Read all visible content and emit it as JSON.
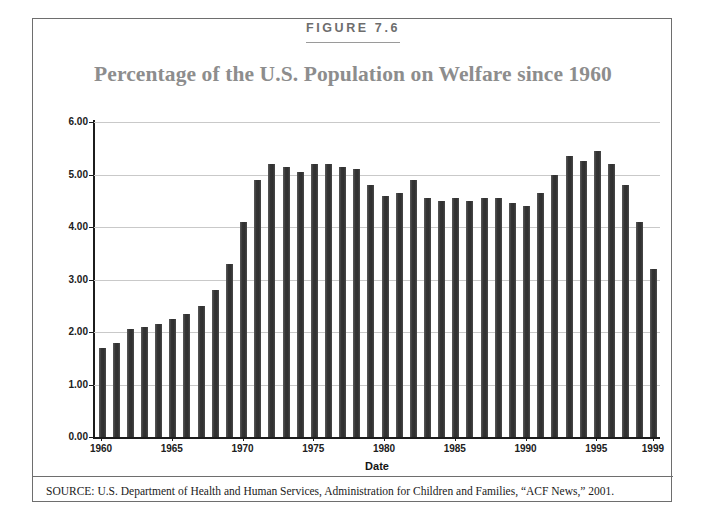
{
  "figure": {
    "label": "FIGURE 7.6",
    "title": "Percentage of the U.S. Population on Welfare since 1960",
    "source": "SOURCE:  U.S. Department of Health and Human Services, Administration for Children and Families, “ACF News,” 2001."
  },
  "colors": {
    "bar": "#3d3d3d",
    "title": "#8d8d8d",
    "label": "#6d6d6d",
    "grid": "#c9c9c9",
    "axis": "#1c1c1c",
    "frame": "#6e6e6e"
  },
  "chart_data": {
    "type": "bar",
    "title": "Percentage of the U.S. Population on Welfare since 1960",
    "xlabel": "Date",
    "ylabel": "Percentage of population on welfare",
    "ylim": [
      0,
      6
    ],
    "ytick_values": [
      0,
      1,
      2,
      3,
      4,
      5,
      6
    ],
    "ytick_labels": [
      "0.00",
      "1.00",
      "2.00",
      "3.00",
      "4.00",
      "5.00",
      "6.00"
    ],
    "xtick_labels": [
      "1960",
      "1965",
      "1970",
      "1975",
      "1980",
      "1985",
      "1990",
      "1995",
      "1999"
    ],
    "grid": true,
    "legend": "none",
    "categories": [
      "1960",
      "1961",
      "1962",
      "1963",
      "1964",
      "1965",
      "1966",
      "1967",
      "1968",
      "1969",
      "1970",
      "1971",
      "1972",
      "1973",
      "1974",
      "1975",
      "1976",
      "1977",
      "1978",
      "1979",
      "1980",
      "1981",
      "1982",
      "1983",
      "1984",
      "1985",
      "1986",
      "1987",
      "1988",
      "1989",
      "1990",
      "1991",
      "1992",
      "1993",
      "1994",
      "1995",
      "1996",
      "1997",
      "1998",
      "1999"
    ],
    "values": [
      1.7,
      1.8,
      2.05,
      2.1,
      2.15,
      2.25,
      2.35,
      2.5,
      2.8,
      3.3,
      4.1,
      4.9,
      5.2,
      5.15,
      5.05,
      5.2,
      5.2,
      5.15,
      5.1,
      4.8,
      4.6,
      4.65,
      4.9,
      4.55,
      4.5,
      4.55,
      4.5,
      4.55,
      4.55,
      4.45,
      4.4,
      4.65,
      5.0,
      5.35,
      5.25,
      5.45,
      5.2,
      4.8,
      4.1,
      3.2
    ]
  }
}
